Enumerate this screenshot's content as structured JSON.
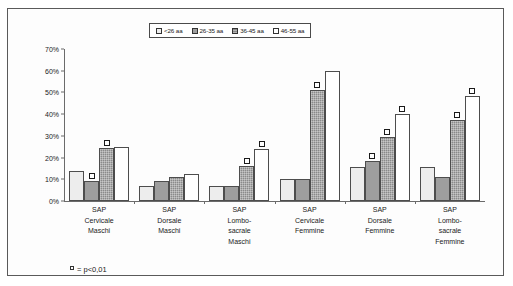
{
  "legend": {
    "position": "top-center",
    "items": [
      {
        "label": "<26 aa",
        "key": "series-key-0"
      },
      {
        "label": "26-35 aa",
        "key": "series-key-1"
      },
      {
        "label": "36-45 aa",
        "key": "series-key-2"
      },
      {
        "label": "46-55 aa",
        "key": "series-key-3"
      }
    ]
  },
  "footnote": {
    "marker": "sig-square-icon",
    "text": "= p<0,01"
  },
  "chart_data": {
    "type": "bar",
    "title": "",
    "xlabel": "",
    "ylabel": "",
    "ylim": [
      0,
      70
    ],
    "ytick_step": 10,
    "grid": false,
    "legend_position": "top-center",
    "yticks": [
      "0%",
      "10%",
      "20%",
      "30%",
      "40%",
      "50%",
      "60%",
      "70%"
    ],
    "categories": [
      "SAP\nCervicale\nMaschi",
      "SAP\nDorsale\nMaschi",
      "SAP\nLombo-\nsacrale\nMaschi",
      "SAP\nCervicale\nFemmine",
      "SAP\nDorsale\nFemmine",
      "SAP\nLombo-\nsacrale\nFemmine"
    ],
    "category_lines": [
      [
        "SAP",
        "Cervicale",
        "Maschi"
      ],
      [
        "SAP",
        "Dorsale",
        "Maschi"
      ],
      [
        "SAP",
        "Lombo-",
        "sacrale",
        "Maschi"
      ],
      [
        "SAP",
        "Cervicale",
        "Femmine"
      ],
      [
        "SAP",
        "Dorsale",
        "Femmine"
      ],
      [
        "SAP",
        "Lombo-",
        "sacrale",
        "Femmine"
      ]
    ],
    "series": [
      {
        "name": "<26 aa",
        "values": [
          14.0,
          7.0,
          7.0,
          10.0,
          15.5,
          15.5
        ]
      },
      {
        "name": "26-35 aa",
        "values": [
          9.0,
          9.0,
          7.0,
          10.0,
          18.5,
          11.0
        ]
      },
      {
        "name": "36-45 aa",
        "values": [
          24.5,
          11.0,
          16.0,
          51.0,
          29.5,
          37.5
        ]
      },
      {
        "name": "46-55 aa",
        "values": [
          25.0,
          12.5,
          24.0,
          60.0,
          40.0,
          48.5
        ]
      }
    ],
    "significance_markers": [
      {
        "group": 0,
        "series": 1,
        "value": 9.0
      },
      {
        "group": 0,
        "series": 2,
        "value": 24.5
      },
      {
        "group": 2,
        "series": 2,
        "value": 16.0
      },
      {
        "group": 2,
        "series": 3,
        "value": 24.0
      },
      {
        "group": 3,
        "series": 2,
        "value": 51.0
      },
      {
        "group": 4,
        "series": 1,
        "value": 18.5
      },
      {
        "group": 4,
        "series": 2,
        "value": 29.5
      },
      {
        "group": 4,
        "series": 3,
        "value": 40.0
      },
      {
        "group": 5,
        "series": 2,
        "value": 37.5
      },
      {
        "group": 5,
        "series": 3,
        "value": 48.5
      }
    ]
  }
}
